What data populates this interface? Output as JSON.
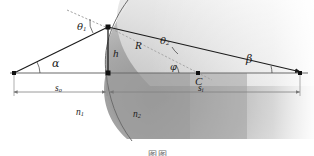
{
  "figure": {
    "type": "optics-refraction-spherical-surface",
    "caption_partial": "图图",
    "labels": {
      "theta1": "θ",
      "theta1_sub": "1",
      "theta2": "θ",
      "theta2_sub": "2",
      "alpha": "α",
      "beta": "β",
      "phi": "φ",
      "height": "h",
      "radius": "R",
      "center": "C",
      "object_distance": "s",
      "object_distance_sub": "o",
      "image_distance": "s",
      "image_distance_sub": "i",
      "index1": "n",
      "index1_sub": "1",
      "index2": "n",
      "index2_sub": "2"
    },
    "colors": {
      "ink": "#1c1c1c",
      "axis": "#555555",
      "dimension": "#777777",
      "glass_dark": "#9a9a9a",
      "glass_light": "#d8d8d8",
      "background": "#ffffff"
    },
    "geometry": {
      "object_point": [
        14,
        73
      ],
      "vertex_point": [
        106,
        73
      ],
      "incidence_point": [
        108,
        27
      ],
      "center_point": [
        198,
        73
      ],
      "image_point": [
        300,
        73
      ],
      "axis_y": 73,
      "dimension_y": 92
    }
  }
}
